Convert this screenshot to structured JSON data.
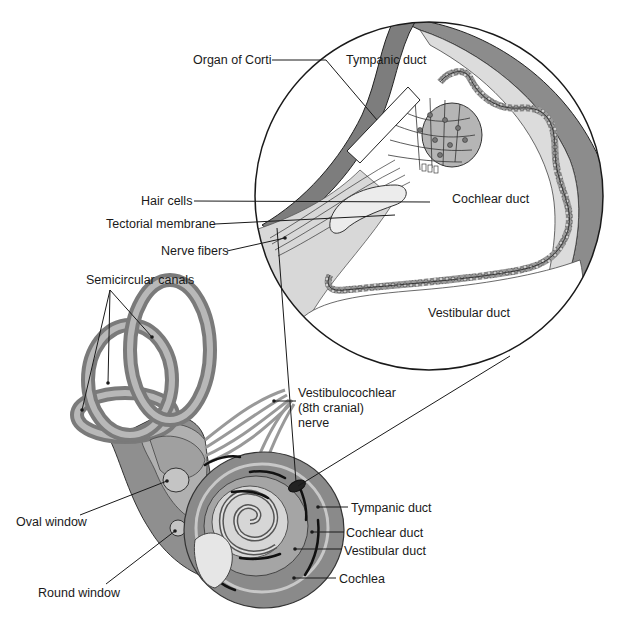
{
  "diagram": {
    "type": "anatomical-illustration",
    "colors": {
      "background": "#ffffff",
      "outline": "#1a1a1a",
      "tissue_dark": "#7a7a7a",
      "tissue_mid": "#a8a8a8",
      "tissue_light": "#d4d4d4",
      "tissue_pale": "#e4e4e4",
      "label_text": "#1a1a1a"
    }
  },
  "inset": {
    "labels": {
      "organ_of_corti": "Organ of Corti",
      "tympanic_duct": "Tympanic duct",
      "cochlear_duct": "Cochlear duct",
      "vestibular_duct": "Vestibular duct",
      "hair_cells": "Hair cells",
      "tectorial_membrane": "Tectorial membrane",
      "nerve_fibers": "Nerve fibers"
    }
  },
  "main": {
    "labels": {
      "semicircular_canals": "Semicircular canals",
      "vestibulocochlear_line1": "Vestibulocochlear",
      "vestibulocochlear_line2": "(8th cranial)",
      "vestibulocochlear_line3": "nerve",
      "oval_window": "Oval window",
      "round_window": "Round window",
      "tympanic_duct": "Tympanic duct",
      "cochlear_duct": "Cochlear duct",
      "vestibular_duct": "Vestibular duct",
      "cochlea": "Cochlea"
    }
  }
}
